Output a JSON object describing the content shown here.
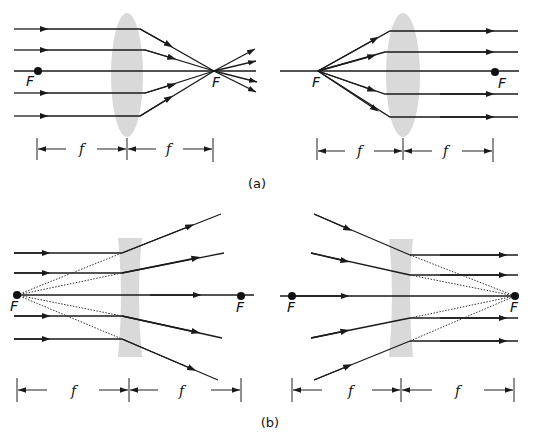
{
  "figure": {
    "panels": [
      {
        "id": "a",
        "caption": "(a)",
        "subfigures": [
          {
            "name": "converging-lens-parallel-in",
            "lens_type": "converging",
            "focal_labels": [
              "F",
              "F"
            ],
            "dimension_labels": [
              "f",
              "f"
            ]
          },
          {
            "name": "converging-lens-point-source",
            "lens_type": "converging",
            "focal_labels": [
              "F",
              "F"
            ],
            "dimension_labels": [
              "f",
              "f"
            ]
          }
        ]
      },
      {
        "id": "b",
        "caption": "(b)",
        "subfigures": [
          {
            "name": "diverging-lens-parallel-in",
            "lens_type": "diverging",
            "focal_labels": [
              "F",
              "F"
            ],
            "dimension_labels": [
              "f",
              "f"
            ]
          },
          {
            "name": "diverging-lens-converging-in",
            "lens_type": "diverging",
            "focal_labels": [
              "F",
              "F"
            ],
            "dimension_labels": [
              "f",
              "f"
            ]
          }
        ]
      }
    ],
    "colors": {
      "ray": "#1a1a1a",
      "lens": "#d9d9d9",
      "background": "#ffffff"
    }
  }
}
